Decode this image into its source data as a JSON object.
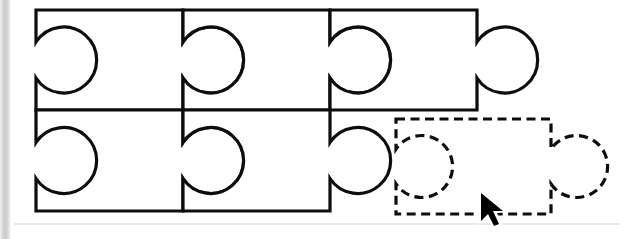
{
  "scene": {
    "title": "Jigsaw Puzzle Assembly Canvas",
    "description": "Line-art diagram of interlocking jigsaw pieces with one dashed ghost piece being dragged into place",
    "background_color": "#ffffff",
    "stroke_color": "#0d0d0d",
    "ghost_stroke_color": "#0d0d0d",
    "scan_strip_color": "#d0d0d0",
    "width": 628,
    "height": 239
  },
  "geometry": {
    "body_left": 36,
    "top_row_top": 10,
    "row_divider_y": 110,
    "bottom_row_bottom": 211,
    "piece_width": 147,
    "tab_radius": 33,
    "neck_half": 18,
    "dash_pattern": "9 5.5",
    "stroke_width": 3.2
  },
  "rows": [
    {
      "name": "top-row",
      "label": "Top row of assembled pieces",
      "piece_count": 3,
      "pieces": [
        {
          "name": "piece-top-1",
          "label": "Top row piece 1",
          "x": 36,
          "tab": "right",
          "socket": "left",
          "state": "placed"
        },
        {
          "name": "piece-top-2",
          "label": "Top row piece 2",
          "x": 183,
          "tab": "right",
          "socket": "left",
          "state": "placed"
        },
        {
          "name": "piece-top-3",
          "label": "Top row piece 3",
          "x": 330,
          "tab": "right",
          "socket": "left",
          "state": "placed"
        }
      ]
    },
    {
      "name": "bottom-row",
      "label": "Bottom row of assembled pieces",
      "piece_count": 2,
      "pieces": [
        {
          "name": "piece-bottom-1",
          "label": "Bottom row piece 1",
          "x": 36,
          "tab": "right",
          "socket": "left",
          "state": "placed"
        },
        {
          "name": "piece-bottom-2",
          "label": "Bottom row piece 2",
          "x": 183,
          "tab": "right",
          "socket": "left",
          "state": "placed"
        }
      ]
    }
  ],
  "ghost_piece": {
    "name": "ghost-piece-dragged",
    "label": "Dashed outline piece being dragged",
    "state": "dragging",
    "style": "dashed",
    "x": 396,
    "y": 119,
    "width": 155,
    "height": 95,
    "tab": "right",
    "socket": "left"
  },
  "cursor": {
    "name": "mouse-cursor",
    "label": "Mouse pointer",
    "type": "arrow",
    "x": 481,
    "y": 194
  },
  "annotations": {
    "faint_bottom_rule_y": 224
  }
}
